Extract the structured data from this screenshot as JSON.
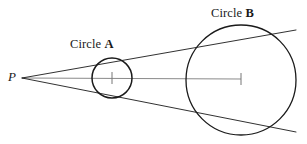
{
  "figure": {
    "background_color": "#ffffff",
    "stroke_color": "#1a1a1a",
    "axis_color": "#777777",
    "width": 307,
    "height": 144
  },
  "labels": {
    "point_p": "P",
    "circle_a_prefix": "Circle ",
    "circle_a_name": "A",
    "circle_b_prefix": "Circle ",
    "circle_b_name": "B"
  },
  "chart_data": {
    "type": "scatter",
    "xlabel": "",
    "ylabel": "",
    "xlim": [
      0,
      307
    ],
    "ylim": [
      144,
      0
    ],
    "grid": false,
    "legend": "none",
    "points": [
      {
        "name": "P",
        "label": "P",
        "x": 22,
        "y": 78
      },
      {
        "name": "center-a",
        "label": "A",
        "x": 112,
        "y": 78
      },
      {
        "name": "center-b",
        "label": "B",
        "x": 241,
        "y": 80
      }
    ],
    "circles": [
      {
        "name": "Circle A",
        "cx": 112,
        "cy": 78,
        "r": 20,
        "stroke": "#1a1a1a",
        "stroke_width": 1.5,
        "fill": "none"
      },
      {
        "name": "Circle B",
        "cx": 241,
        "cy": 80,
        "r": 55,
        "stroke": "#1a1a1a",
        "stroke_width": 1.3,
        "fill": "none"
      }
    ],
    "lines": [
      {
        "name": "axis-of-centers",
        "x1": 22,
        "y1": 78,
        "x2": 241,
        "y2": 79,
        "stroke": "#8a8a8a",
        "stroke_width": 1
      },
      {
        "name": "upper-tangent",
        "x1": 22,
        "y1": 78,
        "x2": 296,
        "y2": 30,
        "stroke": "#1a1a1a",
        "stroke_width": 0.9
      },
      {
        "name": "lower-tangent",
        "x1": 22,
        "y1": 78,
        "x2": 296,
        "y2": 132,
        "stroke": "#1a1a1a",
        "stroke_width": 0.9
      }
    ],
    "ticks": [
      {
        "name": "center-tick-a",
        "x": 112,
        "y": 78,
        "half_height": 6
      },
      {
        "name": "center-tick-b",
        "x": 241,
        "y": 79,
        "half_height": 6
      }
    ]
  }
}
